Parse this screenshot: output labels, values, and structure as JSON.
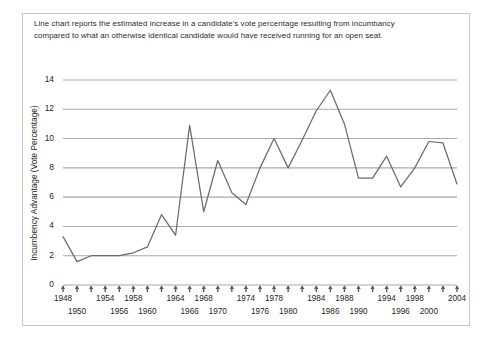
{
  "figure": {
    "caption": "Line chart reports the estimated increase in a candidate's vote percentage resulting from incumbancy compared to what an otherwise identical candidate would have received running for an open seat."
  },
  "chart_data": {
    "type": "line",
    "title": "",
    "xlabel": "",
    "ylabel": "Incumbency Advantage (Vote Percentage)",
    "ylim": [
      0,
      14
    ],
    "yticks": [
      0,
      2,
      4,
      6,
      8,
      10,
      12,
      14
    ],
    "ytick_labels": [
      "0",
      "2",
      "4",
      "6",
      "8",
      "10",
      "12",
      "14"
    ],
    "xlim": [
      1948,
      2004
    ],
    "xticks": [
      1948,
      1950,
      1952,
      1954,
      1956,
      1958,
      1960,
      1962,
      1964,
      1966,
      1968,
      1970,
      1972,
      1974,
      1976,
      1978,
      1980,
      1982,
      1984,
      1986,
      1988,
      1990,
      1992,
      1994,
      1996,
      1998,
      2000,
      2002,
      2004
    ],
    "xtick_labels_upper": [
      "1948",
      "1954",
      "1958",
      "1964",
      "1968",
      "1974",
      "1978",
      "1984",
      "1988",
      "1994",
      "1998",
      "2004"
    ],
    "xtick_labels_lower": [
      "1950",
      "1956",
      "1960",
      "1966",
      "1970",
      "1976",
      "1980",
      "1986",
      "1990",
      "1996",
      "2000"
    ],
    "grid": "horizontal",
    "legend": "none",
    "line_color": "#6b6b6b",
    "grid_color": "#a8a8a8",
    "x": [
      1948,
      1950,
      1952,
      1954,
      1956,
      1958,
      1960,
      1962,
      1964,
      1966,
      1968,
      1970,
      1972,
      1974,
      1976,
      1978,
      1980,
      1982,
      1984,
      1986,
      1988,
      1990,
      1992,
      1994,
      1996,
      1998,
      2000,
      2002,
      2004
    ],
    "values": [
      3.3,
      1.6,
      2.0,
      2.0,
      2.0,
      2.2,
      2.6,
      4.8,
      3.4,
      10.9,
      5.0,
      8.5,
      6.3,
      5.5,
      8.0,
      10.0,
      8.0,
      9.9,
      11.9,
      13.3,
      11.0,
      7.3,
      7.3,
      8.8,
      6.7,
      8.0,
      9.8,
      9.7,
      6.9
    ]
  }
}
